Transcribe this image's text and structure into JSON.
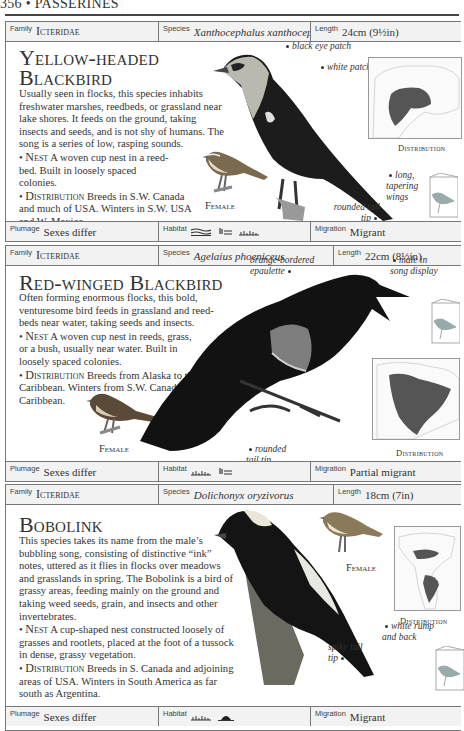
{
  "page": {
    "running_head": "356 • PASSERINES"
  },
  "entries": [
    {
      "family_label": "Family",
      "family": "Icteridae",
      "species_label": "Species",
      "species": "Xanthocephalus xanthocephalus",
      "length_label": "Length",
      "length": "24cm (9½in)",
      "title_line1": "Yellow-headed",
      "title_line2": "Blackbird",
      "description": "Usually seen in flocks, this species inhabits freshwater marshes, reedbeds, or grassland near lake shores. It feeds on the ground, taking insects and seeds, and is not shy of humans. The song is a series of low, rasping sounds.",
      "nest_label": "Nest",
      "nest": "A woven cup nest in a reed-bed. Built in loosely spaced colonies.",
      "distribution_label": "Distribution",
      "distribution": "Breeds in S.W. Canada and much of USA. Winters in S.W. USA and W. Mexico.",
      "female_label": "Female",
      "map_label": "Distribution",
      "annotations": [
        "black eye patch",
        "white patch",
        "long, tapering wings",
        "rounded tail tip"
      ],
      "plumage_label": "Plumage",
      "plumage": "Sexes differ",
      "habitat_label": "Habitat",
      "habitat_icons": [
        "wetland-icon",
        "reedbed-icon",
        "grassland-icon"
      ],
      "migration_label": "Migration",
      "migration": "Migrant"
    },
    {
      "family_label": "Family",
      "family": "Icteridae",
      "species_label": "Species",
      "species": "Agelaius phoeniceus",
      "length_label": "Length",
      "length": "22cm (8½in)",
      "title_line1": "Red-winged Blackbird",
      "description": "Often forming enormous flocks, this bold, venturesome bird feeds in grassland and reed-beds near water, taking seeds and insects.",
      "nest_label": "Nest",
      "nest": "A woven cup nest in reeds, grass, or a bush, usually near water. Built in loosely spaced colonies.",
      "distribution_label": "Distribution",
      "distribution": "Breeds from Alaska to the Caribbean. Winters from S.W. Canada to the Caribbean.",
      "female_label": "Female",
      "map_label": "Distribution",
      "annotations": [
        "orange-bordered epaulette",
        "male in song display",
        "rounded tail tip"
      ],
      "plumage_label": "Plumage",
      "plumage": "Sexes differ",
      "habitat_label": "Habitat",
      "habitat_icons": [
        "grassland-icon",
        "reedbed-icon"
      ],
      "migration_label": "Migration",
      "migration": "Partial migrant"
    },
    {
      "family_label": "Family",
      "family": "Icteridae",
      "species_label": "Species",
      "species": "Dolichonyx oryzivorus",
      "length_label": "Length",
      "length": "18cm (7in)",
      "title_line1": "Bobolink",
      "description": "This species takes its name from the male’s bubbling song, consisting of distinctive “ink” notes, uttered as it flies in flocks over meadows and grasslands in spring. The Bobolink is a bird of grassy areas, feeding mainly on the ground and taking weed seeds, grain, and insects and other invertebrates.",
      "nest_label": "Nest",
      "nest": "A cup-shaped nest constructed loosely of grasses and rootlets, placed at the foot of a tussock in dense, grassy vegetation.",
      "distribution_label": "Distribution",
      "distribution": "Breeds in S. Canada and adjoining areas of USA. Winters in South America as far south as Argentina.",
      "female_label": "Female",
      "map_label": "Distribution",
      "annotations": [
        "white rump and back",
        "spiky tail tip"
      ],
      "plumage_label": "Plumage",
      "plumage": "Sexes differ",
      "habitat_label": "Habitat",
      "habitat_icons": [
        "grassland-icon",
        "scrub-icon"
      ],
      "migration_label": "Migration",
      "migration": "Migrant"
    }
  ]
}
